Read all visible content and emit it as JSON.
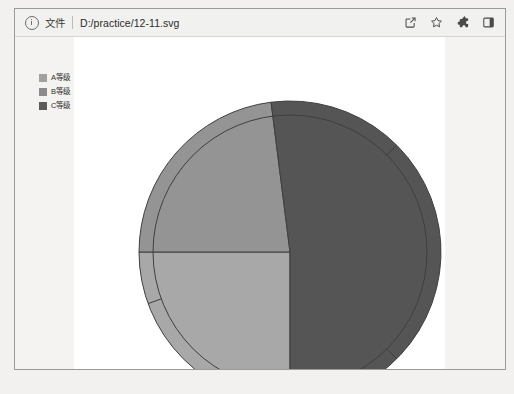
{
  "window": {
    "title": "12-11.svg"
  },
  "toolbar": {
    "info_icon": "info-circle-icon",
    "scheme_label": "文件",
    "url": "D:/practice/12-11.svg",
    "actions": [
      {
        "name": "share-icon",
        "label": "Share this page"
      },
      {
        "name": "bookmark-star-icon",
        "label": "Bookmark this tab"
      },
      {
        "name": "extensions-puzzle-icon",
        "label": "Extensions"
      },
      {
        "name": "side-panel-icon",
        "label": "Show side panel"
      }
    ]
  },
  "legend": {
    "items": [
      {
        "label": "A等级",
        "color": "#a0a0a0"
      },
      {
        "label": "B等级",
        "color": "#8c8c8c"
      },
      {
        "label": "C等级",
        "color": "#5a5a5a"
      }
    ]
  },
  "chart_data": {
    "type": "pie",
    "title": "",
    "labels": [
      "A等级",
      "B等级",
      "C等级"
    ],
    "values": [
      25,
      23,
      52
    ],
    "colors": [
      "#a8a8a8",
      "#949494",
      "#555555"
    ],
    "stroke": "#3f3f3f",
    "start_angle_deg": 180,
    "direction": "clockwise",
    "center": {
      "x": 275,
      "y": 215
    },
    "radius": 151,
    "inner_guide_radius": 137,
    "legend_position": "outside-left",
    "tick_marks_deg": [
      45,
      135,
      250
    ],
    "background": "#ffffff"
  }
}
